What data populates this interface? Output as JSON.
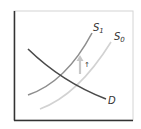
{
  "diagram": {
    "type": "supply-demand",
    "curves": [
      {
        "id": "D",
        "label": "D",
        "subscript": "",
        "color": "#4a4a4a"
      },
      {
        "id": "S1",
        "label": "S",
        "subscript": "1",
        "color": "#8c8c8c"
      },
      {
        "id": "S0",
        "label": "S",
        "subscript": "0",
        "color": "#cfcfcf"
      }
    ],
    "shift_arrow": {
      "direction": "up",
      "color": "#c8c8c8",
      "marker": "↑"
    },
    "colors": {
      "axis": "#333333",
      "frame": "#d0d0d0",
      "background": "#ffffff"
    }
  }
}
